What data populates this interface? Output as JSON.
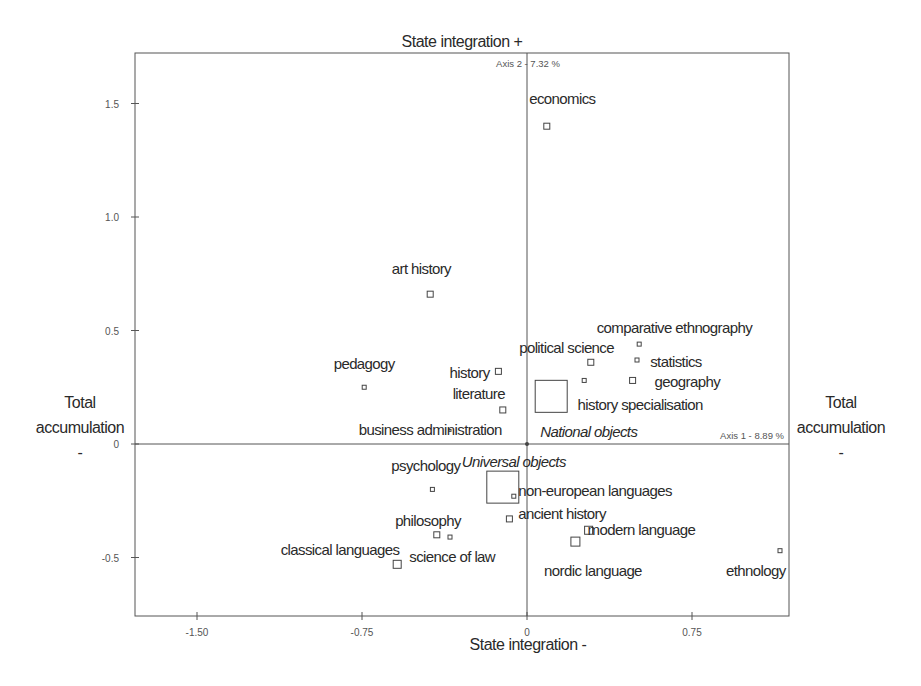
{
  "chart_data": {
    "type": "scatter",
    "title": "",
    "xlabel_top": "State integration +",
    "xlabel_bottom": "State integration -",
    "ylabel_left": [
      "Total",
      "accumulation",
      "-"
    ],
    "ylabel_right": [
      "Total",
      "accumulation",
      "-"
    ],
    "axis1_label": "Axis 1  -  8.89 %",
    "axis2_label": "Axis 2  -  7.32 %",
    "xlim": [
      -1.78,
      1.19
    ],
    "ylim": [
      -0.76,
      1.72
    ],
    "x_ticks": [
      {
        "value": -1.5,
        "label": "-1.50"
      },
      {
        "value": -0.75,
        "label": "-0.75"
      },
      {
        "value": 0,
        "label": "0"
      },
      {
        "value": 0.75,
        "label": "0.75"
      }
    ],
    "y_ticks": [
      {
        "value": 1.5,
        "label": "1.5"
      },
      {
        "value": 1.0,
        "label": "1.0"
      },
      {
        "value": 0.5,
        "label": "0.5"
      },
      {
        "value": 0,
        "label": "0"
      },
      {
        "value": -0.5,
        "label": "-0.5"
      }
    ],
    "grid": false,
    "points": [
      {
        "label": "economics",
        "x": 0.09,
        "y": 1.4,
        "size": 6,
        "lx": 0.01,
        "ly": 1.5,
        "anchor": "start"
      },
      {
        "label": "art history",
        "x": -0.44,
        "y": 0.66,
        "size": 6,
        "lx": -0.48,
        "ly": 0.75,
        "anchor": "middle"
      },
      {
        "label": "pedagogy",
        "x": -0.74,
        "y": 0.25,
        "size": 4,
        "lx": -0.74,
        "ly": 0.33,
        "anchor": "middle"
      },
      {
        "label": "history",
        "x": -0.13,
        "y": 0.32,
        "size": 6,
        "lx": -0.17,
        "ly": 0.29,
        "anchor": "end"
      },
      {
        "label": "literature",
        "x": -0.11,
        "y": 0.15,
        "size": 6,
        "lx": -0.1,
        "ly": 0.2,
        "anchor": "end"
      },
      {
        "label": "business administration",
        "x": -0.35,
        "y": 0.06,
        "size": 2,
        "lx": -0.44,
        "ly": 0.04,
        "anchor": "middle"
      },
      {
        "label": "political science",
        "x": 0.29,
        "y": 0.36,
        "size": 6,
        "lx": 0.18,
        "ly": 0.4,
        "anchor": "middle"
      },
      {
        "label": "comparative ethnography",
        "x": 0.51,
        "y": 0.44,
        "size": 4,
        "lx": 0.67,
        "ly": 0.49,
        "anchor": "middle"
      },
      {
        "label": "statistics",
        "x": 0.5,
        "y": 0.37,
        "size": 4,
        "lx": 0.56,
        "ly": 0.34,
        "anchor": "start"
      },
      {
        "label": "geography",
        "x": 0.48,
        "y": 0.28,
        "size": 6,
        "lx": 0.58,
        "ly": 0.25,
        "anchor": "start"
      },
      {
        "label": "",
        "x": 0.26,
        "y": 0.28,
        "size": 4,
        "lx": 0,
        "ly": 0,
        "anchor": "start"
      },
      {
        "label": "history specialisation",
        "x": 0.11,
        "y": 0.21,
        "size": 32,
        "lx": 0.23,
        "ly": 0.15,
        "anchor": "start"
      },
      {
        "label": "psychology",
        "x": -0.43,
        "y": -0.2,
        "size": 4,
        "lx": -0.46,
        "ly": -0.12,
        "anchor": "middle"
      },
      {
        "label": "",
        "x": -0.11,
        "y": -0.19,
        "size": 32,
        "lx": 0,
        "ly": 0,
        "anchor": "start"
      },
      {
        "label": "non-european languages",
        "x": -0.06,
        "y": -0.23,
        "size": 4,
        "lx": -0.04,
        "ly": -0.23,
        "anchor": "start"
      },
      {
        "label": "ancient history",
        "x": -0.08,
        "y": -0.33,
        "size": 6,
        "lx": -0.04,
        "ly": -0.33,
        "anchor": "start"
      },
      {
        "label": "philosophy",
        "x": -0.41,
        "y": -0.4,
        "size": 6,
        "lx": -0.45,
        "ly": -0.36,
        "anchor": "middle"
      },
      {
        "label": "science of law",
        "x": -0.35,
        "y": -0.41,
        "size": 4,
        "lx": -0.34,
        "ly": -0.52,
        "anchor": "middle"
      },
      {
        "label": "classical languages",
        "x": -0.59,
        "y": -0.53,
        "size": 8,
        "lx": -0.85,
        "ly": -0.49,
        "anchor": "middle"
      },
      {
        "label": "modern language",
        "x": 0.28,
        "y": -0.38,
        "size": 8,
        "lx": 0.52,
        "ly": -0.4,
        "anchor": "middle"
      },
      {
        "label": "nordic language",
        "x": 0.22,
        "y": -0.43,
        "size": 9,
        "lx": 0.3,
        "ly": -0.58,
        "anchor": "middle"
      },
      {
        "label": "ethnology",
        "x": 1.15,
        "y": -0.47,
        "size": 4,
        "lx": 1.04,
        "ly": -0.58,
        "anchor": "middle"
      }
    ],
    "annotations": [
      {
        "text": "National objects",
        "x": 0.06,
        "y": 0.03,
        "italic": true,
        "anchor": "start"
      },
      {
        "text": "Universal objects",
        "x": -0.06,
        "y": -0.1,
        "italic": true,
        "anchor": "middle"
      }
    ]
  }
}
